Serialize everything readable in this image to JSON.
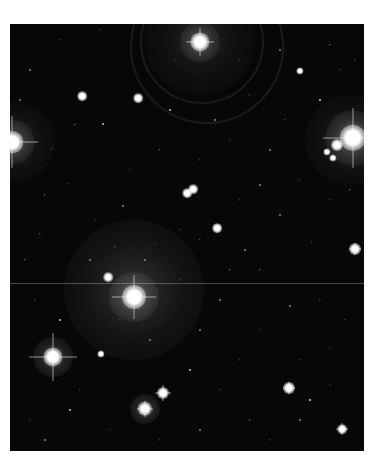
{
  "image": {
    "subject": "starfield with reflection nebulosity",
    "frame": {
      "left": 10,
      "top": 24,
      "width": 354,
      "height": 427,
      "background": "#070707"
    },
    "scanline_y": 283,
    "nebulae": [
      {
        "x": 134,
        "y": 290,
        "r": 70,
        "opacity": 0.22
      },
      {
        "x": 200,
        "y": 40,
        "r": 55,
        "opacity": 0.14
      },
      {
        "x": 350,
        "y": 140,
        "r": 45,
        "opacity": 0.16
      },
      {
        "x": 15,
        "y": 142,
        "r": 40,
        "opacity": 0.15
      }
    ],
    "bright_stars": [
      {
        "x": 134,
        "y": 297,
        "r": 10,
        "spikes": 22
      },
      {
        "x": 200,
        "y": 42,
        "r": 8,
        "spikes": 14
      },
      {
        "x": 353,
        "y": 138,
        "r": 11,
        "spikes": 30
      },
      {
        "x": 12,
        "y": 142,
        "r": 9,
        "spikes": 26
      },
      {
        "x": 53,
        "y": 357,
        "r": 8,
        "spikes": 24
      },
      {
        "x": 145,
        "y": 409,
        "r": 6,
        "spikes": 8
      },
      {
        "x": 163,
        "y": 393,
        "r": 5,
        "spikes": 8
      },
      {
        "x": 289,
        "y": 388,
        "r": 5,
        "spikes": 6
      },
      {
        "x": 355,
        "y": 249,
        "r": 5,
        "spikes": 6
      },
      {
        "x": 342,
        "y": 429,
        "r": 4,
        "spikes": 6
      },
      {
        "x": 108,
        "y": 277,
        "r": 4,
        "spikes": 0
      },
      {
        "x": 337,
        "y": 145,
        "r": 5,
        "spikes": 0
      },
      {
        "x": 327,
        "y": 152,
        "r": 3,
        "spikes": 0
      },
      {
        "x": 333,
        "y": 158,
        "r": 3,
        "spikes": 0
      },
      {
        "x": 187,
        "y": 193,
        "r": 4,
        "spikes": 0
      },
      {
        "x": 193,
        "y": 189,
        "r": 4,
        "spikes": 0
      },
      {
        "x": 217,
        "y": 228,
        "r": 4,
        "spikes": 0
      },
      {
        "x": 82,
        "y": 96,
        "r": 4,
        "spikes": 0
      },
      {
        "x": 138,
        "y": 98,
        "r": 4,
        "spikes": 0
      },
      {
        "x": 300,
        "y": 71,
        "r": 3,
        "spikes": 0
      },
      {
        "x": 101,
        "y": 354,
        "r": 3,
        "spikes": 0
      }
    ],
    "faint_stars": [
      [
        103,
        124
      ],
      [
        52,
        149
      ],
      [
        68,
        184
      ],
      [
        123,
        206
      ],
      [
        115,
        247
      ],
      [
        312,
        242
      ],
      [
        290,
        306
      ],
      [
        330,
        348
      ],
      [
        40,
        234
      ],
      [
        30,
        70
      ],
      [
        60,
        40
      ],
      [
        100,
        30
      ],
      [
        170,
        110
      ],
      [
        250,
        95
      ],
      [
        240,
        60
      ],
      [
        280,
        50
      ],
      [
        330,
        45
      ],
      [
        300,
        180
      ],
      [
        270,
        150
      ],
      [
        230,
        140
      ],
      [
        160,
        150
      ],
      [
        145,
        260
      ],
      [
        95,
        220
      ],
      [
        35,
        300
      ],
      [
        60,
        320
      ],
      [
        80,
        390
      ],
      [
        110,
        430
      ],
      [
        200,
        430
      ],
      [
        250,
        420
      ],
      [
        240,
        360
      ],
      [
        200,
        330
      ],
      [
        180,
        280
      ],
      [
        260,
        270
      ],
      [
        220,
        300
      ],
      [
        320,
        300
      ],
      [
        345,
        320
      ],
      [
        310,
        400
      ],
      [
        270,
        440
      ],
      [
        30,
        420
      ],
      [
        45,
        440
      ],
      [
        200,
        240
      ],
      [
        240,
        200
      ],
      [
        280,
        215
      ],
      [
        330,
        200
      ],
      [
        350,
        190
      ],
      [
        150,
        340
      ],
      [
        120,
        320
      ],
      [
        220,
        390
      ],
      [
        190,
        370
      ],
      [
        260,
        330
      ],
      [
        300,
        360
      ],
      [
        90,
        260
      ],
      [
        25,
        260
      ],
      [
        175,
        60
      ],
      [
        215,
        120
      ],
      [
        130,
        170
      ],
      [
        75,
        125
      ],
      [
        245,
        250
      ],
      [
        155,
        245
      ],
      [
        285,
        120
      ],
      [
        320,
        100
      ],
      [
        340,
        70
      ],
      [
        355,
        60
      ],
      [
        20,
        100
      ],
      [
        45,
        195
      ],
      [
        200,
        160
      ],
      [
        260,
        185
      ],
      [
        180,
        230
      ],
      [
        230,
        270
      ],
      [
        300,
        420
      ],
      [
        330,
        385
      ],
      [
        160,
        440
      ],
      [
        70,
        410
      ]
    ]
  }
}
